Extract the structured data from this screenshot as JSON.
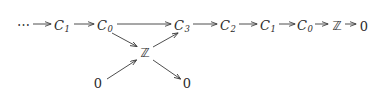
{
  "diagram": {
    "type": "commutative-diagram",
    "background_color": "#ffffff",
    "ink_color": "#2b2b2b",
    "arrow_color": "#3a3a3a",
    "nodes": [
      {
        "id": "ellipsis",
        "label": "⋯",
        "kind": "ellipsis",
        "x": 24,
        "y": 26
      },
      {
        "id": "top-c1-a",
        "base": "C",
        "sub": "1",
        "kind": "italic",
        "x": 62,
        "y": 26
      },
      {
        "id": "top-c0-a",
        "base": "C",
        "sub": "0",
        "kind": "italic",
        "x": 105,
        "y": 26
      },
      {
        "id": "top-c3",
        "base": "C",
        "sub": "3",
        "kind": "italic",
        "x": 182,
        "y": 26
      },
      {
        "id": "top-c2",
        "base": "C",
        "sub": "2",
        "kind": "italic",
        "x": 228,
        "y": 26
      },
      {
        "id": "top-c1-b",
        "base": "C",
        "sub": "1",
        "kind": "italic",
        "x": 268,
        "y": 26
      },
      {
        "id": "top-c0-b",
        "base": "C",
        "sub": "0",
        "kind": "italic",
        "x": 305,
        "y": 26
      },
      {
        "id": "top-z",
        "label": "ℤ",
        "kind": "blackboard",
        "x": 337,
        "y": 26
      },
      {
        "id": "top-zero",
        "label": "0",
        "kind": "upright",
        "x": 364,
        "y": 26
      },
      {
        "id": "center-z",
        "label": "ℤ",
        "kind": "blackboard",
        "x": 145,
        "y": 53
      },
      {
        "id": "bottom-zero-left",
        "label": "0",
        "kind": "upright",
        "x": 98,
        "y": 83
      },
      {
        "id": "bottom-zero-right",
        "label": "0",
        "kind": "upright",
        "x": 187,
        "y": 83
      }
    ],
    "arrows": [
      {
        "id": "arrow-ellipsis-to-c1",
        "from": "ellipsis",
        "to": "top-c1-a",
        "x1": 33,
        "y1": 24,
        "x2": 52,
        "y2": 24,
        "style": "short"
      },
      {
        "id": "arrow-c1-to-c0",
        "from": "top-c1-a",
        "to": "top-c0-a",
        "x1": 74,
        "y1": 24,
        "x2": 95,
        "y2": 24,
        "style": "long"
      },
      {
        "id": "arrow-c0-to-c3",
        "from": "top-c0-a",
        "to": "top-c3",
        "x1": 117,
        "y1": 24,
        "x2": 172,
        "y2": 24,
        "style": "extra-long"
      },
      {
        "id": "arrow-c3-to-c2",
        "from": "top-c3",
        "to": "top-c2",
        "x1": 193,
        "y1": 24,
        "x2": 218,
        "y2": 24,
        "style": "long"
      },
      {
        "id": "arrow-c2-to-c1",
        "from": "top-c2",
        "to": "top-c1-b",
        "x1": 239,
        "y1": 24,
        "x2": 258,
        "y2": 24,
        "style": "short"
      },
      {
        "id": "arrow-c1-to-c0-b",
        "from": "top-c1-b",
        "to": "top-c0-b",
        "x1": 279,
        "y1": 24,
        "x2": 296,
        "y2": 24,
        "style": "short"
      },
      {
        "id": "arrow-c0-to-z",
        "from": "top-c0-b",
        "to": "top-z",
        "x1": 316,
        "y1": 24,
        "x2": 329,
        "y2": 24,
        "style": "short"
      },
      {
        "id": "arrow-z-to-zero",
        "from": "top-z",
        "to": "top-zero",
        "x1": 345,
        "y1": 24,
        "x2": 357,
        "y2": 24,
        "style": "short"
      },
      {
        "id": "arrow-c0-down-to-z",
        "from": "top-c0-a",
        "to": "center-z",
        "x1": 112,
        "y1": 33,
        "x2": 138,
        "y2": 47,
        "style": "diagonal"
      },
      {
        "id": "arrow-z-up-to-c3",
        "from": "center-z",
        "to": "top-c3",
        "x1": 153,
        "y1": 47,
        "x2": 178,
        "y2": 33,
        "style": "diagonal"
      },
      {
        "id": "arrow-zero-up-to-z",
        "from": "bottom-zero-left",
        "to": "center-z",
        "x1": 107,
        "y1": 79,
        "x2": 137,
        "y2": 60,
        "style": "diagonal"
      },
      {
        "id": "arrow-z-down-to-zero",
        "from": "center-z",
        "to": "bottom-zero-right",
        "x1": 153,
        "y1": 60,
        "x2": 181,
        "y2": 79,
        "style": "diagonal"
      }
    ]
  }
}
